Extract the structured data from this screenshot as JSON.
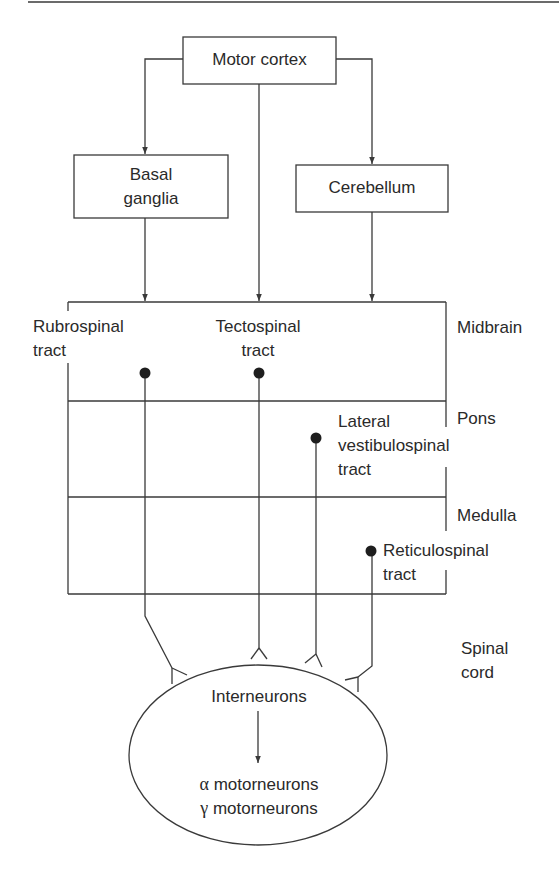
{
  "diagram": {
    "type": "flowchart",
    "colors": {
      "line": "#3a3a3a",
      "text": "#2a2a2a",
      "background": "#ffffff"
    },
    "boxes": {
      "motor_cortex": "Motor cortex",
      "basal_ganglia": [
        "Basal",
        "ganglia"
      ],
      "cerebellum": "Cerebellum"
    },
    "tracts": {
      "rubrospinal": [
        "Rubrospinal",
        "tract"
      ],
      "tectospinal": [
        "Tectospinal",
        "tract"
      ],
      "lateral_vestibulospinal": [
        "Lateral",
        "vestibulospinal",
        "tract"
      ],
      "reticulospinal": [
        "Reticulospinal",
        "tract"
      ]
    },
    "regions": {
      "midbrain": "Midbrain",
      "pons": "Pons",
      "medulla": "Medulla",
      "spinal_cord": [
        "Spinal",
        "cord"
      ]
    },
    "target": {
      "interneurons": "Interneurons",
      "alpha_symbol": "α",
      "gamma_symbol": "γ",
      "alpha": "motorneurons",
      "gamma": "motorneurons"
    },
    "edges": [
      {
        "from": "Motor cortex",
        "to": "Basal ganglia"
      },
      {
        "from": "Motor cortex",
        "to": "Cerebellum"
      },
      {
        "from": "Motor cortex",
        "to": "Brainstem (Tectospinal level)"
      },
      {
        "from": "Basal ganglia",
        "to": "Brainstem (Rubrospinal level)"
      },
      {
        "from": "Cerebellum",
        "to": "Brainstem"
      },
      {
        "from": "Interneurons",
        "to": "α/γ motorneurons"
      }
    ]
  }
}
